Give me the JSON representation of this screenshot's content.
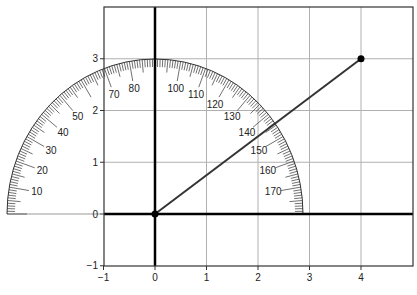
{
  "chart_data": {
    "type": "line",
    "title": "",
    "xlabel": "",
    "ylabel": "",
    "xlim": [
      -1,
      5
    ],
    "ylim": [
      -1,
      4
    ],
    "grid": true,
    "x_ticks": [
      -1,
      0,
      1,
      2,
      3,
      4
    ],
    "y_ticks": [
      -1,
      0,
      1,
      2,
      3
    ],
    "x_tick_labels": [
      "−1",
      "0",
      "1",
      "2",
      "3",
      "4"
    ],
    "y_tick_labels": [
      "−1",
      "0",
      "1",
      "2",
      "3"
    ],
    "series": [
      {
        "name": "ray",
        "x": [
          0,
          4
        ],
        "y": [
          0,
          3
        ],
        "markers": true
      }
    ],
    "annotations": {
      "protractor": {
        "center": [
          0,
          0
        ],
        "radius_units": 3,
        "zero_side": "left",
        "labels": [
          10,
          20,
          30,
          40,
          50,
          70,
          80,
          100,
          110,
          120,
          130,
          140,
          150,
          160,
          170
        ]
      }
    }
  },
  "layout": {
    "plot_left_px": 104,
    "plot_top_px": 7,
    "plot_right_px": 413,
    "plot_bottom_px": 266,
    "origin_px": [
      155,
      214
    ],
    "unit_x_px": 51.5,
    "unit_y_px": 51.75,
    "protractor_rx_px": 148,
    "protractor_ry_px": 155
  },
  "colors": {
    "grid": "#b0b0b0",
    "axis": "#000000",
    "frame": "#333333",
    "ray": "#333333",
    "ticks": "#333333",
    "point": "#000000"
  }
}
